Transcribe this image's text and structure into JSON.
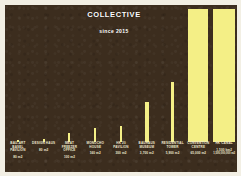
{
  "poster": {
    "background_color": "#3c2d1e",
    "bar_color": "#f4ef86",
    "text_color": "#f0ead2",
    "title": "COLLECTIVE",
    "subtitle": "since 2015"
  },
  "chart_data": {
    "type": "bar",
    "title": "COLLECTIVE",
    "subtitle": "since 2015",
    "xlabel": "",
    "ylabel": "",
    "grid": false,
    "legend": "none",
    "unit": "m2",
    "scale_note": "bar heights are not linear with values; smallest projects render as near-zero ticks",
    "categories": [
      "BAU-ART BASEL PAVILION",
      "DESIGN HAUS",
      "MEAT FREEZER OFFICE",
      "MONOCHO HOUSE",
      "HK 20 PAVILION",
      "BAUHAUS MUSEUM",
      "RESIDENTIAL TOWER",
      "CONVENTION CENTRE",
      "HK CANAL"
    ],
    "values": [
      80,
      80,
      100,
      160,
      300,
      3700,
      5900,
      65000,
      1000000000
    ],
    "value_labels": [
      "80 m2",
      "80 m2",
      "100 m2",
      "160 m2",
      "300 m2",
      "3,700 m2",
      "5,900 m2",
      "65,000 m2",
      "1,000,000,000 m2"
    ],
    "bar_heights_pct": [
      1.5,
      2.0,
      6.5,
      10.0,
      11.5,
      29.0,
      44.0,
      97.0,
      97.0
    ],
    "bar_widths_px": [
      2,
      2,
      2,
      2,
      2,
      4,
      3,
      20,
      22
    ]
  },
  "bars": [
    {
      "name": "BAU-ART BASEL PAVILION",
      "value": "80 m2",
      "value2": ""
    },
    {
      "name": "DESIGN HAUS",
      "value": "80 m2",
      "value2": ""
    },
    {
      "name": "MEAT FREEZER OFFICE",
      "value": "100 m2",
      "value2": ""
    },
    {
      "name": "MONOCHO HOUSE",
      "value": "160 m2",
      "value2": ""
    },
    {
      "name": "HK 20 PAVILION",
      "value": "300 m2",
      "value2": ""
    },
    {
      "name": "BAUHAUS MUSEUM",
      "value": "3,700 m2",
      "value2": ""
    },
    {
      "name": "RESIDENTIAL TOWER",
      "value": "5,900 m2",
      "value2": ""
    },
    {
      "name": "CONVENTION CENTRE",
      "value": "65,000 m2",
      "value2": ""
    },
    {
      "name": "HK CANAL",
      "value": "1,500 km2",
      "value2": "1,500,000,000 m2"
    }
  ]
}
